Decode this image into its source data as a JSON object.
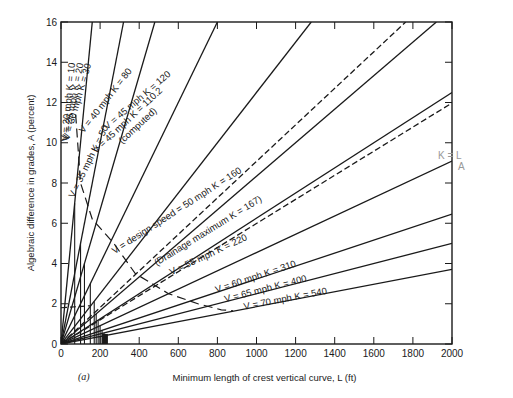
{
  "chart_data": {
    "type": "line",
    "title": "",
    "xlabel": "Minimum length of crest vertical curve, L (ft)",
    "ylabel": "Algebraic difference in grades, A (percent)",
    "xlim": [
      0,
      2000
    ],
    "ylim": [
      0,
      16
    ],
    "xticks": [
      0,
      200,
      400,
      600,
      800,
      1000,
      1200,
      1400,
      1600,
      1800,
      2000
    ],
    "yticks": [
      0,
      2,
      4,
      6,
      8,
      10,
      12,
      14,
      16
    ],
    "grid": false,
    "formula": "A = L / K",
    "series": [
      {
        "name": "V = 20 mph K = 10",
        "K": 10,
        "style": "solid",
        "label": "V = 20 mph K = 10"
      },
      {
        "name": "V = 25 mph K = 20",
        "K": 20,
        "style": "solid",
        "label": "V = 25 mph K = 20"
      },
      {
        "name": "V = 30 mph K = 30",
        "K": 30,
        "style": "solid",
        "label": "V = 30 mph K = 30"
      },
      {
        "name": "V = 35 mph K = 50",
        "K": 50,
        "style": "solid",
        "label": "V = 35 mph K = 50"
      },
      {
        "name": "V = 40 mph K = 80",
        "K": 80,
        "style": "solid",
        "label": "V = 40 mph K = 80"
      },
      {
        "name": "V = 45 mph K = 110.2 (computed)",
        "K": 110.2,
        "style": "dashed",
        "label": "V = 45 mph K = 110.2",
        "sublabel": "(computed)"
      },
      {
        "name": "V = 45 mph K = 120",
        "K": 120,
        "style": "solid",
        "label": "V = 45 mph K = 120"
      },
      {
        "name": "V = design speed = 50 mph K = 160",
        "K": 160,
        "style": "solid",
        "label": "V = design speed = 50 mph K = 160"
      },
      {
        "name": "Drainage maximum K = 167",
        "K": 167,
        "style": "dashed",
        "label": "(Drainage maximum K = 167)"
      },
      {
        "name": "V = 55 mph K = 220",
        "K": 220,
        "style": "solid",
        "label": "V = 55 mph K = 220"
      },
      {
        "name": "V = 60 mph K = 310",
        "K": 310,
        "style": "solid",
        "label": "V = 60 mph K = 310"
      },
      {
        "name": "V = 65 mph K = 400",
        "K": 400,
        "style": "solid",
        "label": "V = 65 mph K = 400"
      },
      {
        "name": "V = 70 mph K = 540",
        "K": 540,
        "style": "solid",
        "label": "V = 70 mph K = 540"
      }
    ],
    "boundary_curve": {
      "style": "long-dash",
      "points": [
        [
          75,
          11.4
        ],
        [
          100,
          8
        ],
        [
          160,
          6.2
        ],
        [
          270,
          5
        ],
        [
          380,
          3.5
        ],
        [
          550,
          2.5
        ],
        [
          700,
          2
        ],
        [
          820,
          1.7
        ],
        [
          880,
          1.65
        ]
      ]
    },
    "drainage_dashed_start": {
      "x": 0,
      "y": 1.8
    }
  },
  "labels": {
    "panel": "(a)",
    "annotation": "K = L / A",
    "annotation_top": "K =  L",
    "annotation_bottom": "A"
  }
}
